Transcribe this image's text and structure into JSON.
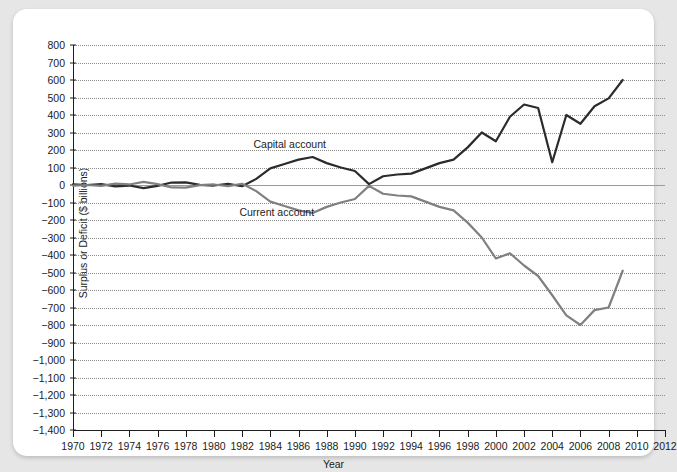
{
  "chart_data": {
    "type": "line",
    "title": "",
    "xlabel": "Year",
    "ylabel": "Surplus or Deficit ($ billions)",
    "xlim": [
      1970,
      2012
    ],
    "ylim": [
      -1400,
      800
    ],
    "grid": true,
    "legend_position": "inline-annotation",
    "xticks": [
      1970,
      1972,
      1974,
      1976,
      1978,
      1980,
      1982,
      1984,
      1986,
      1988,
      1990,
      1992,
      1994,
      1996,
      1998,
      2000,
      2002,
      2004,
      2006,
      2008,
      2010,
      2012
    ],
    "xtick_labels": [
      "1970",
      "1972",
      "1974",
      "1976",
      "1978",
      "1980",
      "1982",
      "1984",
      "1986",
      "1988",
      "1990",
      "1992",
      "1994",
      "1996",
      "1998",
      "2000",
      "2002",
      "2004",
      "2006",
      "2008",
      "2010",
      "2012"
    ],
    "yticks": [
      800,
      700,
      600,
      500,
      400,
      300,
      200,
      100,
      0,
      -100,
      -200,
      -300,
      -400,
      -500,
      -600,
      -700,
      -800,
      -900,
      -1000,
      -1100,
      -1200,
      -1300,
      -1400
    ],
    "ytick_labels": [
      "800",
      "700",
      "600",
      "500",
      "400",
      "300",
      "200",
      "100",
      "0",
      "−100",
      "−200",
      "−300",
      "−400",
      "−500",
      "−600",
      "−700",
      "−800",
      "−900",
      "−1,000",
      "−1,100",
      "−1,200",
      "−1,300",
      "−1,400"
    ],
    "x": [
      1970,
      1971,
      1972,
      1973,
      1974,
      1975,
      1976,
      1977,
      1978,
      1979,
      1980,
      1981,
      1982,
      1983,
      1984,
      1985,
      1986,
      1987,
      1988,
      1989,
      1990,
      1991,
      1992,
      1993,
      1994,
      1995,
      1996,
      1997,
      1998,
      1999,
      2000,
      2001,
      2002,
      2003,
      2004,
      2005,
      2006,
      2007,
      2008,
      2009
    ],
    "series": [
      {
        "name": "Capital account",
        "color": "#2b2b2b",
        "label_x": 1986,
        "label_y": 230,
        "values": [
          3,
          0,
          5,
          -8,
          -3,
          -18,
          -5,
          14,
          15,
          1,
          -3,
          6,
          -7,
          35,
          95,
          120,
          145,
          160,
          125,
          100,
          80,
          5,
          50,
          60,
          65,
          95,
          125,
          145,
          215,
          300,
          250,
          390,
          460,
          440,
          130,
          400,
          350,
          450,
          495,
          600
        ]
      },
      {
        "name": "Current account",
        "color": "#808080",
        "label_x": 1985,
        "label_y": -160,
        "values": [
          -3,
          0,
          -5,
          8,
          3,
          18,
          5,
          -14,
          -15,
          -1,
          3,
          -6,
          7,
          -35,
          -95,
          -120,
          -145,
          -160,
          -125,
          -100,
          -80,
          -5,
          -50,
          -60,
          -65,
          -95,
          -125,
          -145,
          -215,
          -300,
          -420,
          -390,
          -460,
          -520,
          -630,
          -745,
          -800,
          -715,
          -700,
          -490
        ]
      }
    ]
  }
}
